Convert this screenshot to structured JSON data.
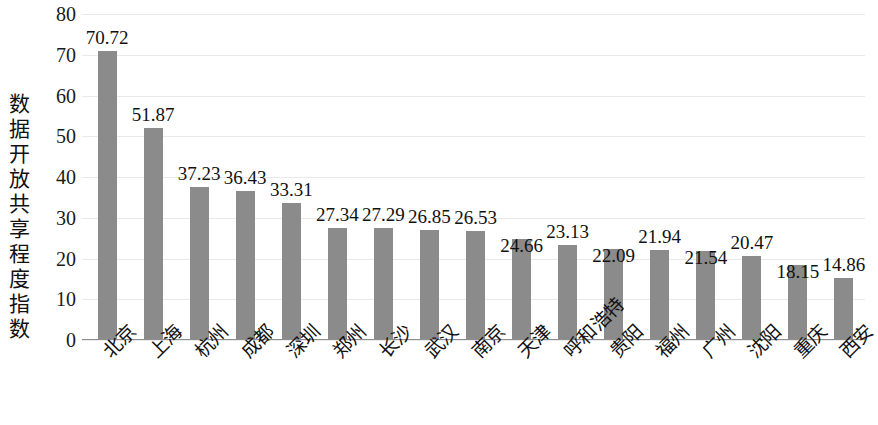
{
  "chart_data": {
    "type": "bar",
    "title": "",
    "subtitle": "",
    "xlabel": "",
    "ylabel": "数据开放共享程度指数",
    "ylim": [
      0,
      80
    ],
    "yticks": [
      80,
      70,
      60,
      50,
      40,
      30,
      20,
      10,
      0
    ],
    "grid": true,
    "legend": null,
    "bar_color": "#8b8b8b",
    "categories": [
      "北京",
      "上海",
      "杭州",
      "成都",
      "深圳",
      "郑州",
      "长沙",
      "武汉",
      "南京",
      "天津",
      "呼和浩特",
      "贵阳",
      "福州",
      "广州",
      "沈阳",
      "重庆",
      "西安"
    ],
    "values": [
      70.72,
      51.87,
      37.23,
      36.43,
      33.31,
      27.34,
      27.29,
      26.85,
      26.53,
      24.66,
      23.13,
      22.09,
      21.94,
      21.54,
      20.47,
      18.15,
      14.86
    ],
    "value_labels": [
      "70.72",
      "51.87",
      "37.23",
      "36.43",
      "33.31",
      "27.34",
      "27.29",
      "26.85",
      "26.53",
      "24.66",
      "23.13",
      "22.09",
      "21.94",
      "21.54",
      "20.47",
      "18.15",
      "14.86"
    ]
  }
}
